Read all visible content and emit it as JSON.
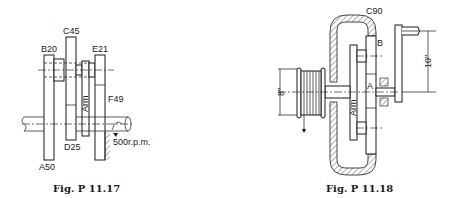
{
  "figures": [
    {
      "id": "fig1",
      "caption": "Fig. P 11.17",
      "labels": {
        "A": "A50",
        "B": "B20",
        "C": "C45",
        "D": "D25",
        "E": "E21",
        "F": "F49",
        "arm": "Arm",
        "speed": "500r.p.m."
      }
    },
    {
      "id": "fig2",
      "caption": "Fig. P 11.18",
      "labels": {
        "C": "C90",
        "B": "B",
        "A": "A",
        "arm": "Arm",
        "crank_radius": "10\"",
        "drum_diameter": "8\""
      }
    }
  ]
}
